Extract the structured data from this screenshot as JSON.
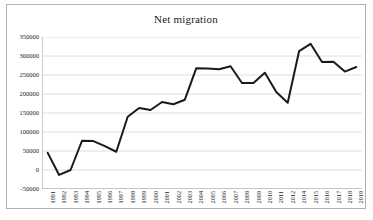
{
  "chart_data": {
    "type": "line",
    "title": "Net migration",
    "xlabel": "",
    "ylabel": "",
    "ylim": [
      -50000,
      350000
    ],
    "ytick_values": [
      350000,
      300000,
      250000,
      200000,
      150000,
      100000,
      50000,
      0,
      -50000
    ],
    "ytick_labels": [
      "350000",
      "300000",
      "250000",
      "200000",
      "150000",
      "100000",
      "50000",
      "0",
      "-50000"
    ],
    "grid": "horizontal",
    "legend": "none",
    "line_color": "#1a1a1a",
    "categories": [
      "1991",
      "1992",
      "1993",
      "1994",
      "1995",
      "1996",
      "1997",
      "1998",
      "1999",
      "2000",
      "2001",
      "2002",
      "2003",
      "2004",
      "2005",
      "2006",
      "2007",
      "2008",
      "2009",
      "2010",
      "2011",
      "2012",
      "2014",
      "2015",
      "2016",
      "2017",
      "2018",
      "2019"
    ],
    "values": [
      45000,
      -13000,
      0,
      77000,
      76000,
      63000,
      48000,
      140000,
      163000,
      158000,
      179000,
      173000,
      185000,
      268000,
      267000,
      265000,
      273000,
      229000,
      229000,
      256000,
      205000,
      177000,
      313000,
      332000,
      284000,
      285000,
      259000,
      271000
    ],
    "series": [
      {
        "name": "Net migration",
        "values": [
          45000,
          -13000,
          0,
          77000,
          76000,
          63000,
          48000,
          140000,
          163000,
          158000,
          179000,
          173000,
          185000,
          268000,
          267000,
          265000,
          273000,
          229000,
          229000,
          256000,
          205000,
          177000,
          313000,
          332000,
          284000,
          285000,
          259000,
          271000
        ]
      }
    ]
  }
}
